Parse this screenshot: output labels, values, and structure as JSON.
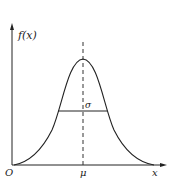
{
  "figure": {
    "type": "normal-distribution-curve",
    "y_axis_label": "f(x)",
    "x_axis_label": "x",
    "origin_label": "O",
    "mean_label": "μ",
    "width_label": "σ",
    "colors": {
      "stroke": "#222222",
      "background": "#ffffff"
    }
  }
}
